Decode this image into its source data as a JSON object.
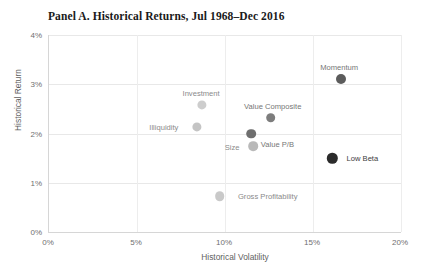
{
  "chart_data": {
    "type": "scatter",
    "title": "Panel A. Historical Returns, Jul 1968–Dec 2016",
    "xlabel": "Historical Volatility",
    "ylabel": "Historical Return",
    "xlim": [
      0,
      20
    ],
    "ylim": [
      0,
      4
    ],
    "xticks": [
      "0%",
      "5%",
      "10%",
      "15%",
      "20%"
    ],
    "xtick_values": [
      0,
      5,
      10,
      15,
      20
    ],
    "yticks": [
      "0%",
      "1%",
      "2%",
      "3%",
      "4%"
    ],
    "ytick_values": [
      0,
      1,
      2,
      3,
      4
    ],
    "grid": true,
    "legend": "none",
    "x_unit": "%",
    "y_unit": "%",
    "points": [
      {
        "label": "Momentum",
        "x": 16.6,
        "y": 3.1,
        "color": "#5c5c5c",
        "radius": 5.0,
        "label_dx": -2,
        "label_dy": -12,
        "label_tone": "mid"
      },
      {
        "label": "Investment",
        "x": 8.7,
        "y": 2.58,
        "color": "#cdcdcd",
        "radius": 4.6,
        "label_dx": -1,
        "label_dy": -12,
        "label_tone": "light"
      },
      {
        "label": "Value Composite",
        "x": 12.6,
        "y": 2.32,
        "color": "#7d7d7d",
        "radius": 4.8,
        "label_dx": 2,
        "label_dy": -12,
        "label_tone": "mid"
      },
      {
        "label": "Illiquidity",
        "x": 8.4,
        "y": 2.13,
        "color": "#c4c4c4",
        "radius": 4.6,
        "label_dx": -33,
        "label_dy": 0,
        "label_tone": "light"
      },
      {
        "label": "Value P/B",
        "x": 11.5,
        "y": 2.0,
        "color": "#6e6e6e",
        "radius": 4.8,
        "label_dx": 26,
        "label_dy": 10,
        "label_tone": "mid"
      },
      {
        "label": "Size",
        "x": 11.6,
        "y": 1.74,
        "color": "#b9b9b9",
        "radius": 4.8,
        "label_dx": -21,
        "label_dy": 1,
        "label_tone": "light"
      },
      {
        "label": "Low Beta",
        "x": 16.1,
        "y": 1.5,
        "color": "#2b2b2b",
        "radius": 5.2,
        "label_dx": 30,
        "label_dy": 0,
        "label_tone": "dark"
      },
      {
        "label": "Gross Profitability",
        "x": 9.7,
        "y": 0.73,
        "color": "#c9c9c9",
        "radius": 4.8,
        "label_dx": 48,
        "label_dy": 0,
        "label_tone": "light"
      }
    ]
  },
  "axes": {
    "plot_left_px": 48,
    "plot_top_px": 35,
    "plot_width_px": 352,
    "plot_height_px": 197
  }
}
